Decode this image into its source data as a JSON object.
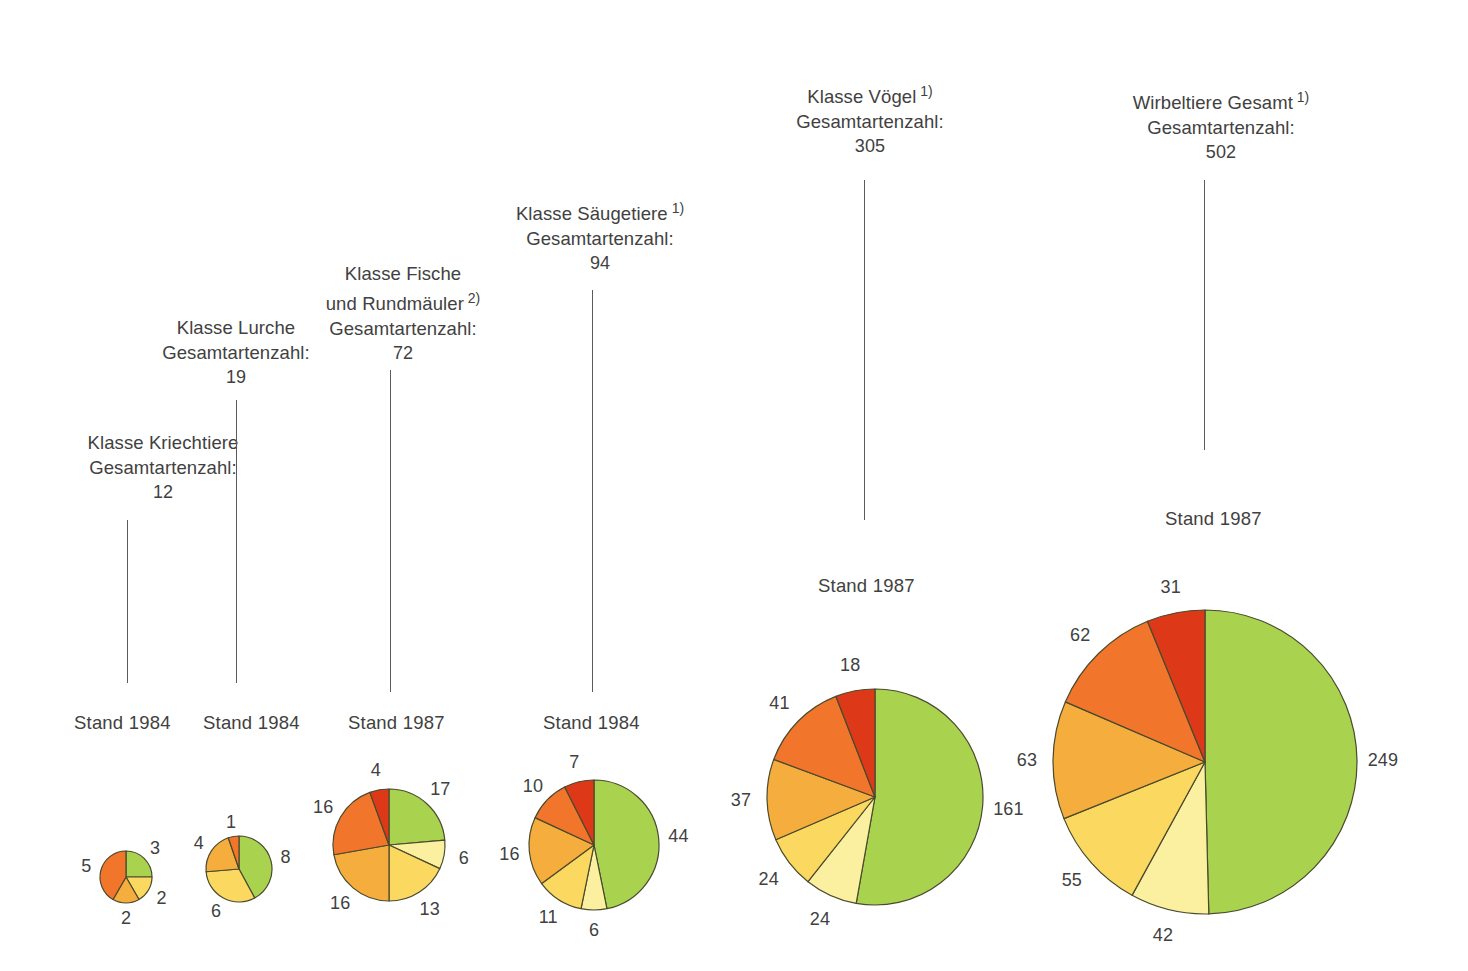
{
  "chart_data": {
    "type": "pie",
    "palette": {
      "green": "#a9d24f",
      "pale_yellow": "#fbf0a0",
      "yellow": "#fbd961",
      "orange_yellow": "#f5ad3d",
      "orange": "#f1762b",
      "red": "#dd3919",
      "outline": "#4a4a2e",
      "leader_line": "#5b5b5b",
      "text": "#414141",
      "background": "#ffffff"
    },
    "charts": [
      {
        "id": "kriechtiere",
        "title_lines": [
          "Klasse Kriechtiere",
          "Gesamtartenzahl:"
        ],
        "superscript": "",
        "total": "12",
        "stand_label": "Stand 1984",
        "radius": 26,
        "slices": [
          {
            "label": "3",
            "value": 3,
            "color": "green"
          },
          {
            "label": "2",
            "value": 2,
            "color": "yellow"
          },
          {
            "label": "2",
            "value": 2,
            "color": "orange_yellow"
          },
          {
            "label": "5",
            "value": 5,
            "color": "orange"
          }
        ]
      },
      {
        "id": "lurche",
        "title_lines": [
          "Klasse Lurche",
          "Gesamtartenzahl:"
        ],
        "superscript": "",
        "total": "19",
        "stand_label": "Stand 1984",
        "radius": 33,
        "slices": [
          {
            "label": "8",
            "value": 8,
            "color": "green"
          },
          {
            "label": "6",
            "value": 6,
            "color": "yellow"
          },
          {
            "label": "4",
            "value": 4,
            "color": "orange_yellow"
          },
          {
            "label": "1",
            "value": 1,
            "color": "orange"
          }
        ]
      },
      {
        "id": "fische",
        "title_lines": [
          "Klasse Fische",
          "und Rundmäuler",
          "Gesamtartenzahl:"
        ],
        "superscript": "2)",
        "total": "72",
        "stand_label": "Stand 1987",
        "radius": 56,
        "slices": [
          {
            "label": "17",
            "value": 17,
            "color": "green"
          },
          {
            "label": "6",
            "value": 6,
            "color": "pale_yellow"
          },
          {
            "label": "13",
            "value": 13,
            "color": "yellow"
          },
          {
            "label": "16",
            "value": 16,
            "color": "orange_yellow"
          },
          {
            "label": "16",
            "value": 16,
            "color": "orange"
          },
          {
            "label": "4",
            "value": 4,
            "color": "red"
          }
        ]
      },
      {
        "id": "saeugetiere",
        "title_lines": [
          "Klasse Säugetiere",
          "Gesamtartenzahl:"
        ],
        "superscript": "1)",
        "total": "94",
        "stand_label": "Stand 1984",
        "radius": 65,
        "slices": [
          {
            "label": "44",
            "value": 44,
            "color": "green"
          },
          {
            "label": "6",
            "value": 6,
            "color": "pale_yellow"
          },
          {
            "label": "11",
            "value": 11,
            "color": "yellow"
          },
          {
            "label": "16",
            "value": 16,
            "color": "orange_yellow"
          },
          {
            "label": "10",
            "value": 10,
            "color": "orange"
          },
          {
            "label": "7",
            "value": 7,
            "color": "red"
          }
        ]
      },
      {
        "id": "voegel",
        "title_lines": [
          "Klasse Vögel",
          "Gesamtartenzahl:"
        ],
        "superscript": "1)",
        "total": "305",
        "stand_label": "Stand 1987",
        "radius": 108,
        "slices": [
          {
            "label": "161",
            "value": 161,
            "color": "green"
          },
          {
            "label": "24",
            "value": 24,
            "color": "pale_yellow"
          },
          {
            "label": "24",
            "value": 24,
            "color": "yellow"
          },
          {
            "label": "37",
            "value": 37,
            "color": "orange_yellow"
          },
          {
            "label": "41",
            "value": 41,
            "color": "orange"
          },
          {
            "label": "18",
            "value": 18,
            "color": "red"
          }
        ]
      },
      {
        "id": "wirbeltiere-gesamt",
        "title_lines": [
          "Wirbeltiere Gesamt",
          "Gesamtartenzahl:"
        ],
        "superscript": "1)",
        "total": "502",
        "stand_label": "Stand 1987",
        "radius": 152,
        "slices": [
          {
            "label": "249",
            "value": 249,
            "color": "green"
          },
          {
            "label": "42",
            "value": 42,
            "color": "pale_yellow"
          },
          {
            "label": "55",
            "value": 55,
            "color": "yellow"
          },
          {
            "label": "63",
            "value": 63,
            "color": "orange_yellow"
          },
          {
            "label": "62",
            "value": 62,
            "color": "orange"
          },
          {
            "label": "31",
            "value": 31,
            "color": "red"
          }
        ]
      }
    ]
  },
  "layout": {
    "captions": [
      {
        "id": "kriechtiere",
        "left": 163,
        "top": 430,
        "leader_x": 127,
        "leader_top": 520,
        "leader_bottom": 683
      },
      {
        "id": "lurche",
        "left": 236,
        "top": 315,
        "leader_x": 236,
        "leader_top": 400,
        "leader_bottom": 683
      },
      {
        "id": "fische",
        "left": 403,
        "top": 261,
        "leader_x": 390,
        "leader_top": 370,
        "leader_bottom": 692
      },
      {
        "id": "saeugetiere",
        "left": 600,
        "top": 196,
        "leader_x": 592,
        "leader_top": 290,
        "leader_bottom": 692
      },
      {
        "id": "voegel",
        "left": 870,
        "top": 79,
        "leader_x": 864,
        "leader_top": 180,
        "leader_bottom": 520
      },
      {
        "id": "wirbeltiere-gesamt",
        "left": 1221,
        "top": 85,
        "leader_x": 1204,
        "leader_top": 180,
        "leader_bottom": 450
      }
    ],
    "stands": [
      {
        "id": "kriechtiere",
        "left": 74,
        "top": 712
      },
      {
        "id": "lurche",
        "left": 203,
        "top": 712
      },
      {
        "id": "fische",
        "left": 348,
        "top": 712
      },
      {
        "id": "saeugetiere",
        "left": 543,
        "top": 712
      },
      {
        "id": "voegel",
        "left": 818,
        "top": 575
      },
      {
        "id": "wirbeltiere-gesamt",
        "left": 1165,
        "top": 508
      }
    ],
    "pies": [
      {
        "id": "kriechtiere",
        "cx": 126,
        "cy": 877
      },
      {
        "id": "lurche",
        "cx": 239,
        "cy": 869
      },
      {
        "id": "fische",
        "cx": 389,
        "cy": 845
      },
      {
        "id": "saeugetiere",
        "cx": 594,
        "cy": 845
      },
      {
        "id": "voegel",
        "cx": 875,
        "cy": 797
      },
      {
        "id": "wirbeltiere-gesamt",
        "cx": 1205,
        "cy": 762
      }
    ]
  }
}
